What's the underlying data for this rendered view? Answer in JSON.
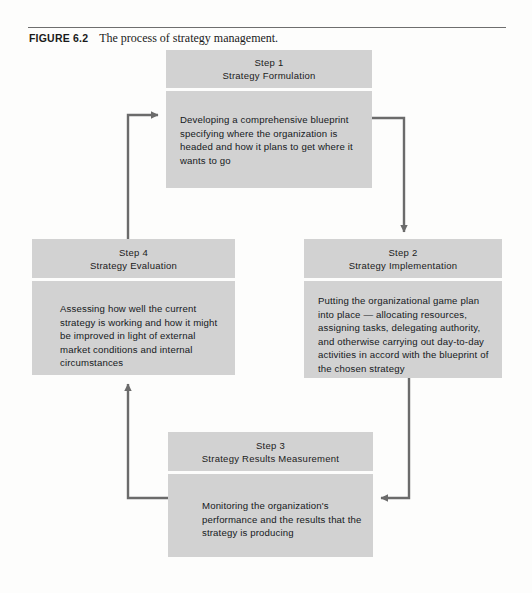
{
  "figure": {
    "number": "FIGURE 6.2",
    "caption": "The process of strategy management."
  },
  "diagram": {
    "type": "cycle-flowchart",
    "direction": "clockwise",
    "box_fill": "#d2d2d2",
    "arrow_color": "#6b6b6b",
    "steps": [
      {
        "id": "step1",
        "step_label": "Step 1",
        "title": "Strategy Formulation",
        "body": "Developing a comprehensive blueprint specifying where the organization is headed and how it plans to get where it wants to go"
      },
      {
        "id": "step2",
        "step_label": "Step 2",
        "title": "Strategy Implementation",
        "body": "Putting the organizational game plan into place — allocating resources, assigning tasks, delegating authority, and otherwise carrying out day-to-day activities in accord with the blueprint of the chosen strategy"
      },
      {
        "id": "step3",
        "step_label": "Step 3",
        "title": "Strategy Results Measurement",
        "body": "Monitoring the organization's performance and the results that the strategy is producing"
      },
      {
        "id": "step4",
        "step_label": "Step 4",
        "title": "Strategy Evaluation",
        "body": "Assessing how well the current strategy is working and how it might be improved in light of external market conditions and internal circumstances"
      }
    ],
    "connections": [
      {
        "from": "step1",
        "to": "step2",
        "name": "arrow-step1-to-step2"
      },
      {
        "from": "step2",
        "to": "step3",
        "name": "arrow-step2-to-step3"
      },
      {
        "from": "step3",
        "to": "step4",
        "name": "arrow-step3-to-step4"
      },
      {
        "from": "step4",
        "to": "step1",
        "name": "arrow-step4-to-step1"
      }
    ]
  }
}
